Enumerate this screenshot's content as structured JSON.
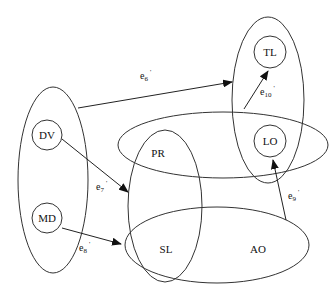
{
  "diagram": {
    "type": "hypergraph",
    "stroke_color": "#333333",
    "background": "#ffffff",
    "nodes": [
      {
        "id": "DV",
        "label": "DV",
        "cx": 47,
        "cy": 135,
        "r": 15
      },
      {
        "id": "MD",
        "label": "MD",
        "cx": 47,
        "cy": 218,
        "r": 15
      },
      {
        "id": "TL",
        "label": "TL",
        "cx": 270,
        "cy": 52,
        "r": 16
      },
      {
        "id": "LO",
        "label": "LO",
        "cx": 270,
        "cy": 141,
        "r": 16
      },
      {
        "id": "PR",
        "label": "PR",
        "x": 155,
        "y": 155
      },
      {
        "id": "SL",
        "label": "SL",
        "x": 165,
        "y": 252
      },
      {
        "id": "AO",
        "label": "AO",
        "x": 258,
        "y": 252
      }
    ],
    "groups": [
      {
        "id": "group-dv-md",
        "cx": 53,
        "cy": 180,
        "rx": 35,
        "ry": 93
      },
      {
        "id": "group-pr-sl-vertical",
        "cx": 165,
        "cy": 206,
        "rx": 37,
        "ry": 76
      },
      {
        "id": "group-pr-lo-horizontal",
        "cx": 223,
        "cy": 145,
        "rx": 105,
        "ry": 33
      },
      {
        "id": "group-tl-lo",
        "cx": 268,
        "cy": 100,
        "rx": 36,
        "ry": 83
      },
      {
        "id": "group-sl-ao",
        "cx": 217,
        "cy": 245,
        "rx": 92,
        "ry": 38
      }
    ],
    "edges": [
      {
        "id": "e6",
        "label": "e",
        "sub": "6",
        "prime": "'",
        "from": "group-dv-md",
        "to": "group-tl-lo",
        "label_x": 120,
        "label_y": 79
      },
      {
        "id": "e7",
        "label": "e",
        "sub": "7",
        "prime": "'",
        "from": "DV",
        "to": "group-pr-sl-vertical",
        "label_x": 97,
        "label_y": 190
      },
      {
        "id": "e8",
        "label": "e",
        "sub": "8",
        "prime": "'",
        "from": "MD",
        "to": "group-sl-ao",
        "label_x": 80,
        "label_y": 250
      },
      {
        "id": "e9",
        "label": "e",
        "sub": "9",
        "prime": "'",
        "from": "group-sl-ao",
        "to": "LO",
        "label_x": 288,
        "label_y": 199
      },
      {
        "id": "e10",
        "label": "e",
        "sub": "10",
        "prime": "'",
        "from": "group-pr-lo-horizontal",
        "to": "TL",
        "label_x": 261,
        "label_y": 95
      }
    ]
  }
}
